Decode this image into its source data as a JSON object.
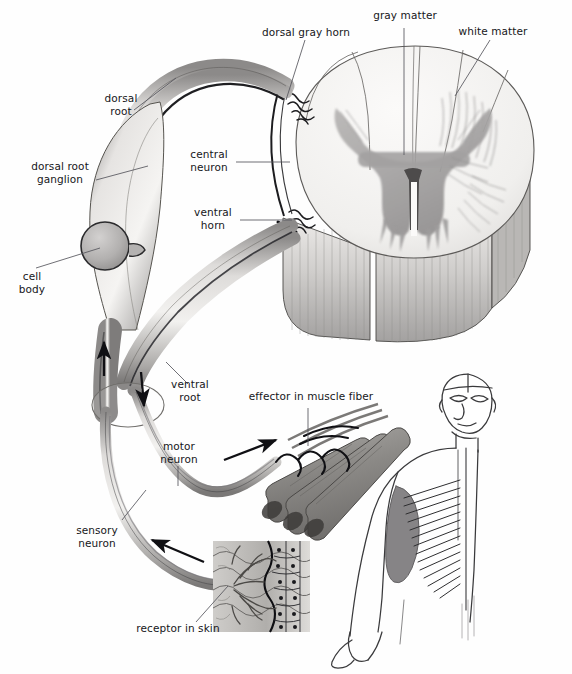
{
  "figure": {
    "type": "anatomical-diagram",
    "background_color": "#fefefe",
    "ink_color": "#16161a",
    "leader_line_color": "#55555c"
  },
  "labels": {
    "dorsal_gray_horn": "dorsal gray horn",
    "gray_matter": "gray matter",
    "white_matter": "white matter",
    "dorsal_root": "dorsal\nroot",
    "dorsal_root_ganglion": "dorsal root\nganglion",
    "central_neuron": "central\nneuron",
    "ventral_horn": "ventral\nhorn",
    "cell_body": "cell\nbody",
    "ventral_root": "ventral\nroot",
    "motor_neuron": "motor\nneuron",
    "sensory_neuron": "sensory\nneuron",
    "effector_in_muscle_fiber": "effector in muscle fiber",
    "receptor_in_skin": "receptor in skin"
  },
  "structures": {
    "spinal_cord": {
      "name": "spinal cord cross-section",
      "gray_matter_fill": "#a9a7a8",
      "white_matter_fill": "#f3f2f1",
      "cut_face_fill": "#d9d7d5"
    },
    "nerve_trunk": {
      "name": "spinal nerve trunk",
      "fill": "#c9c7c6"
    },
    "ganglion": {
      "name": "dorsal root ganglion",
      "fill": "#dcdad8"
    },
    "cell_body": {
      "name": "sensory cell body",
      "fill": "#b6b4b4"
    },
    "muscle": {
      "name": "skeletal muscle fibers",
      "fill": "#8e8c8a"
    },
    "skin": {
      "name": "skin receptor block",
      "fill": "#b9b7b5"
    },
    "human_figure": {
      "name": "human figure reference",
      "fill": "#ffffff",
      "stroke": "#3a3a3c"
    }
  },
  "flow_arrows": [
    {
      "name": "sensory-afferent-arrow-ganglion",
      "direction": "up",
      "pathway": "sensory"
    },
    {
      "name": "motor-efferent-arrow-ventral-root",
      "direction": "down",
      "pathway": "motor"
    },
    {
      "name": "motor-efferent-arrow-to-muscle",
      "direction": "right",
      "pathway": "motor"
    },
    {
      "name": "sensory-afferent-arrow-from-skin",
      "direction": "left",
      "pathway": "sensory"
    }
  ]
}
